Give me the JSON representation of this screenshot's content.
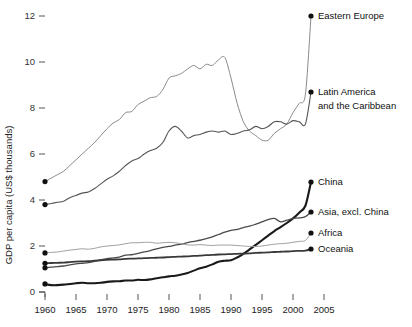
{
  "chart_data": {
    "type": "line",
    "title": "",
    "subtitle": "",
    "xlabel": "",
    "ylabel": "GDP per capita (US$ thousands)",
    "xlim": [
      1960,
      2007
    ],
    "ylim": [
      0,
      12.6
    ],
    "grid": false,
    "legend_position": "inline-right-endpoint-labels",
    "x_ticks": [
      1960,
      1965,
      1970,
      1975,
      1980,
      1985,
      1990,
      1995,
      2000,
      2005
    ],
    "x_tick_labels": [
      "1960",
      "1965",
      "1970",
      "1975",
      "1980",
      "1985",
      "1990",
      "1995",
      "2000",
      "2005"
    ],
    "y_ticks": [
      0,
      2,
      4,
      6,
      8,
      10,
      12
    ],
    "y_tick_labels": [
      "0",
      "2",
      "4",
      "6",
      "8",
      "10",
      "12"
    ],
    "x": [
      1960,
      1961,
      1962,
      1963,
      1964,
      1965,
      1966,
      1967,
      1968,
      1969,
      1970,
      1971,
      1972,
      1973,
      1974,
      1975,
      1976,
      1977,
      1978,
      1979,
      1980,
      1981,
      1982,
      1983,
      1984,
      1985,
      1986,
      1987,
      1988,
      1989,
      1990,
      1991,
      1992,
      1993,
      1994,
      1995,
      1996,
      1997,
      1998,
      1999,
      2000,
      2001,
      2002,
      2003,
      2004,
      2005,
      2006,
      2007
    ],
    "series": [
      {
        "name": "Eastern Europe",
        "label": "Eastern Europe",
        "color": "#8a8a8a",
        "width": 1.0,
        "end_value": 11.8,
        "values": [
          4.8,
          4.95,
          5.1,
          5.25,
          5.5,
          5.75,
          6.0,
          6.25,
          6.5,
          6.8,
          7.1,
          7.35,
          7.5,
          7.8,
          7.85,
          8.15,
          8.3,
          8.45,
          8.5,
          8.8,
          9.3,
          9.4,
          9.5,
          9.7,
          9.85,
          9.7,
          9.9,
          9.85,
          10.1,
          10.2,
          9.3,
          8.2,
          7.4,
          7.0,
          6.8,
          6.6,
          6.6,
          6.9,
          7.1,
          7.3,
          7.8,
          8.2,
          8.6,
          9.1,
          9.8,
          10.3,
          11.0,
          11.8
        ]
      },
      {
        "name": "Latin America and the Caribbean",
        "label": "Latin America\nand the Caribbean",
        "label_line1": "Latin America",
        "label_line2": "and the Caribbean",
        "color": "#555555",
        "width": 1.1,
        "end_value": 8.7,
        "values": [
          3.8,
          3.85,
          3.9,
          3.95,
          4.1,
          4.2,
          4.3,
          4.35,
          4.5,
          4.7,
          4.9,
          5.05,
          5.25,
          5.5,
          5.7,
          5.8,
          6.0,
          6.15,
          6.25,
          6.5,
          7.0,
          7.2,
          7.0,
          6.7,
          6.8,
          6.85,
          6.95,
          7.0,
          6.95,
          7.0,
          6.85,
          6.9,
          7.0,
          7.05,
          7.2,
          7.1,
          7.2,
          7.4,
          7.4,
          7.3,
          7.45,
          7.4,
          7.3,
          7.35,
          7.6,
          7.9,
          8.3,
          8.7
        ]
      },
      {
        "name": "China",
        "label": "China",
        "color": "#1a1a1a",
        "width": 2.1,
        "end_value": 4.8,
        "values": [
          0.35,
          0.3,
          0.3,
          0.32,
          0.35,
          0.38,
          0.4,
          0.38,
          0.38,
          0.4,
          0.44,
          0.46,
          0.47,
          0.5,
          0.5,
          0.53,
          0.52,
          0.55,
          0.6,
          0.64,
          0.68,
          0.71,
          0.76,
          0.83,
          0.93,
          1.03,
          1.1,
          1.2,
          1.32,
          1.36,
          1.38,
          1.5,
          1.66,
          1.85,
          2.05,
          2.25,
          2.45,
          2.65,
          2.82,
          3.0,
          3.2,
          3.45,
          3.75,
          4.05,
          4.4,
          4.8,
          5.3,
          5.9
        ]
      },
      {
        "name": "Asia, excl. China",
        "label": "Asia, excl. China",
        "color": "#4a4a4a",
        "width": 1.3,
        "end_value": 3.5,
        "values": [
          1.05,
          1.08,
          1.1,
          1.13,
          1.18,
          1.22,
          1.25,
          1.28,
          1.33,
          1.4,
          1.45,
          1.48,
          1.52,
          1.6,
          1.62,
          1.68,
          1.74,
          1.8,
          1.88,
          1.94,
          1.98,
          2.04,
          2.08,
          2.15,
          2.2,
          2.25,
          2.32,
          2.4,
          2.5,
          2.6,
          2.68,
          2.72,
          2.8,
          2.86,
          2.95,
          3.05,
          3.15,
          3.2,
          3.05,
          3.12,
          3.2,
          3.22,
          3.28,
          3.35,
          3.42,
          3.5,
          3.62,
          3.75
        ]
      },
      {
        "name": "Africa",
        "label": "Africa",
        "color": "#a0a0a0",
        "width": 1.0,
        "end_value": 2.6,
        "values": [
          1.7,
          1.72,
          1.74,
          1.78,
          1.82,
          1.85,
          1.88,
          1.86,
          1.9,
          1.96,
          2.0,
          2.02,
          2.05,
          2.1,
          2.14,
          2.14,
          2.16,
          2.16,
          2.12,
          2.14,
          2.16,
          2.14,
          2.1,
          2.05,
          2.04,
          2.06,
          2.04,
          2.02,
          2.04,
          2.04,
          2.04,
          2.02,
          2.0,
          1.98,
          1.98,
          2.0,
          2.04,
          2.08,
          2.1,
          2.12,
          2.16,
          2.2,
          2.24,
          2.3,
          2.4,
          2.5,
          2.6,
          2.72
        ]
      },
      {
        "name": "Oceania",
        "label": "Oceania",
        "color": "#3a3a3a",
        "width": 1.8,
        "end_value": 1.9,
        "values": [
          1.25,
          1.26,
          1.27,
          1.28,
          1.3,
          1.32,
          1.33,
          1.34,
          1.36,
          1.38,
          1.4,
          1.41,
          1.42,
          1.44,
          1.45,
          1.46,
          1.47,
          1.48,
          1.49,
          1.5,
          1.52,
          1.53,
          1.54,
          1.55,
          1.57,
          1.58,
          1.6,
          1.61,
          1.63,
          1.64,
          1.65,
          1.66,
          1.67,
          1.68,
          1.7,
          1.71,
          1.72,
          1.74,
          1.75,
          1.76,
          1.78,
          1.79,
          1.8,
          1.82,
          1.84,
          1.86,
          1.88,
          1.9
        ]
      }
    ]
  }
}
